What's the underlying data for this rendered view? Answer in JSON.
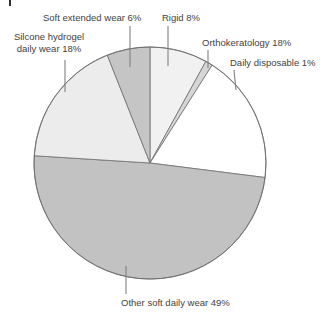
{
  "labels": {
    "soft_extended": "Soft extended wear 6%",
    "rigid": "Rigid 8%",
    "orthokeratology": "Orthokeratology 18%",
    "daily_disposable": "Daily disposable 1%",
    "silicone_hydrogel_line1": "Silcone hydrogel",
    "silicone_hydrogel_line2": "daily wear 18%",
    "other_soft": "Other soft daily wear 49%"
  },
  "chart_data": {
    "type": "pie",
    "categories": [
      "Rigid",
      "Daily disposable",
      "Orthokeratology",
      "Other soft daily wear",
      "Silcone hydrogel daily wear",
      "Soft extended wear"
    ],
    "values": [
      8,
      1,
      18,
      49,
      18,
      6
    ],
    "unit": "%",
    "slice_ids": [
      "rigid",
      "daily-disposable",
      "orthokeratology",
      "other-soft-daily-wear",
      "silicone-hydrogel-daily-wear",
      "soft-extended-wear"
    ],
    "colors": [
      "#f1f1f1",
      "#d6d6d6",
      "#ffffff",
      "#c2c2c2",
      "#ececec",
      "#c5c5c5"
    ],
    "start_angle_deg": 0,
    "direction": "clockwise",
    "stroke_color": "#6e6e6e",
    "leader_line_color": "#808080",
    "text_color": "#424242",
    "background": "#ffffff",
    "legend": "none",
    "labels_outside_with_leader_lines": true
  }
}
